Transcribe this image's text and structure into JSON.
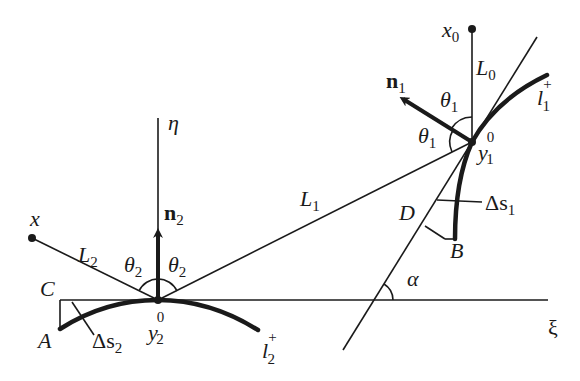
{
  "diagram": {
    "type": "geometric-optics-reflection",
    "points": {
      "y2_0": {
        "x": 158,
        "y": 300
      },
      "y1_0": {
        "x": 472,
        "y": 142
      },
      "x": {
        "x": 32,
        "y": 238
      },
      "x0": {
        "x": 472,
        "y": 29
      },
      "alpha_vertex": {
        "x": 374,
        "y": 300
      }
    },
    "colors": {
      "ink": "#1a1a1a",
      "background": "#ffffff"
    }
  },
  "labels": {
    "eta": "η",
    "xi": "ξ",
    "n2": "n",
    "n2_sub": "2",
    "n1": "n",
    "n1_sub": "1",
    "x": "x",
    "x0": "x",
    "x0_sub": "0",
    "L0": "L",
    "L0_sub": "0",
    "L1": "L",
    "L1_sub": "1",
    "L2": "L",
    "L2_sub": "2",
    "theta2_left": "θ",
    "theta2_left_sub": "2",
    "theta2_right": "θ",
    "theta2_right_sub": "2",
    "theta1_top": "θ",
    "theta1_top_sub": "1",
    "theta1_left": "θ",
    "theta1_left_sub": "1",
    "y1_0": "y",
    "y1_0_sub": "1",
    "y1_0_sup": "0",
    "y2_0": "y",
    "y2_0_sub": "2",
    "y2_0_sup": "0",
    "l1_plus": "l",
    "l1_plus_sub": "1",
    "l1_plus_sup": "+",
    "l2_plus": "l",
    "l2_plus_sub": "2",
    "l2_plus_sup": "+",
    "delta_s1": "Δs",
    "delta_s1_sub": "1",
    "delta_s2": "Δs",
    "delta_s2_sub": "2",
    "A": "A",
    "B": "B",
    "C": "C",
    "D": "D",
    "alpha": "α"
  }
}
